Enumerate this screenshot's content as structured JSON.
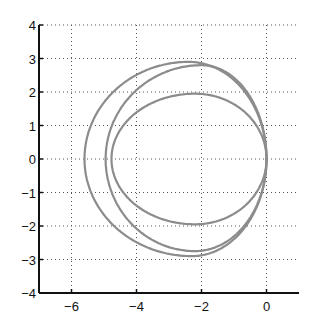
{
  "chart_data": {
    "type": "line",
    "title": "",
    "xlabel": "",
    "ylabel": "",
    "xlim": [
      -7,
      1
    ],
    "ylim": [
      -4,
      4
    ],
    "grid": true,
    "grid_style": "dotted",
    "legend": null,
    "xticks": [
      -6,
      -4,
      -2,
      0
    ],
    "xtick_labels": [
      "−6",
      "−4",
      "−2",
      "0"
    ],
    "yticks": [
      -4,
      -3,
      -2,
      -1,
      0,
      1,
      2,
      3,
      4
    ],
    "ytick_labels": [
      "−4",
      "−3",
      "−2",
      "−1",
      "0",
      "1",
      "2",
      "3",
      "4"
    ],
    "line_color": "#8c8c8c",
    "series": [
      {
        "name": "outer curve",
        "description": "closed curve through origin",
        "leftmost_x": -5.6,
        "top_y": 2.9,
        "bottom_y": -2.9,
        "x_at_top": -2.4,
        "x_at_bottom": -2.3
      },
      {
        "name": "middle curve",
        "description": "closed curve through origin",
        "leftmost_x": -4.95,
        "top_y": 2.8,
        "bottom_y": -2.75,
        "x_at_top": -2.0,
        "x_at_bottom": -2.2
      },
      {
        "name": "inner curve",
        "description": "closed curve through origin",
        "leftmost_x": -4.77,
        "top_y": 1.95,
        "bottom_y": -1.95,
        "x_at_top": -2.2,
        "x_at_bottom": -2.2
      }
    ]
  }
}
